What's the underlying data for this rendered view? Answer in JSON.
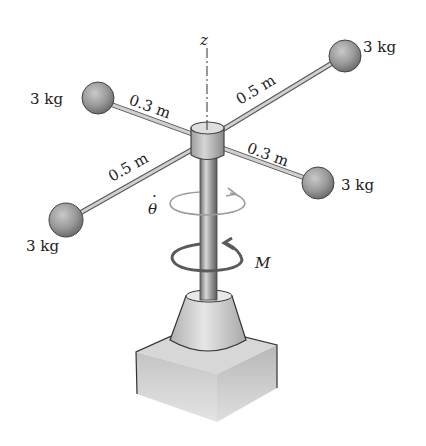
{
  "figure": {
    "axis_label": "z",
    "masses": [
      {
        "id": "upper-left",
        "label": "3 kg",
        "arm_length": "0.3 m"
      },
      {
        "id": "upper-right",
        "label": "3 kg",
        "arm_length": "0.5 m"
      },
      {
        "id": "lower-right",
        "label": "3 kg",
        "arm_length": "0.3 m"
      },
      {
        "id": "lower-left",
        "label": "3 kg",
        "arm_length": "0.5 m"
      }
    ],
    "angular_velocity_symbol": "θ",
    "angular_velocity_dot": "·",
    "moment_label": "M"
  },
  "colors": {
    "background": "#ffffff",
    "ball": "#9a9a9a",
    "rod": "#c8c8c8",
    "outline": "#444444",
    "arrow_light": "#9c9c9c",
    "arrow_dark": "#5a5a5a"
  }
}
